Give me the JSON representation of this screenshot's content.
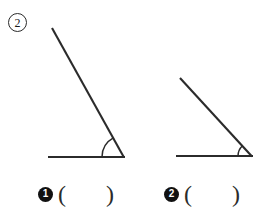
{
  "worksheet": {
    "problem_number": "2",
    "problem_number_badge_style": "circled-outline",
    "ink_color": "#2b2b2b",
    "background_color": "#ffffff"
  },
  "figures": [
    {
      "label": "1",
      "name": "angle-figure-1",
      "description": "acute angle opening to the left, steeper ray",
      "vertex": {
        "x": 124,
        "y": 157
      },
      "baseline_end": {
        "x": 48,
        "y": 157
      },
      "ray_end": {
        "x": 52,
        "y": 28
      },
      "angle_degrees": 59,
      "arc_radius": 22,
      "arc_label": ""
    },
    {
      "label": "2",
      "name": "angle-figure-2",
      "description": "acute angle opening to the left, shallower ray",
      "vertex": {
        "x": 252,
        "y": 156
      },
      "baseline_end": {
        "x": 176,
        "y": 156
      },
      "ray_end": {
        "x": 180,
        "y": 78
      },
      "angle_degrees": 45,
      "arc_radius": 14,
      "arc_label": ""
    }
  ],
  "answers": [
    {
      "bullet": "1",
      "open_paren": "(",
      "value": "",
      "close_paren": ")"
    },
    {
      "bullet": "2",
      "open_paren": "(",
      "value": "",
      "close_paren": ")"
    }
  ]
}
